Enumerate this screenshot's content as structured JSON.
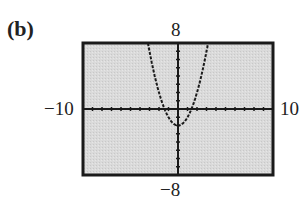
{
  "figure": {
    "part_label": "(b)",
    "window_labels": {
      "ymax": "8",
      "ymin": "−8",
      "xmin": "−10",
      "xmax": "10"
    },
    "colors": {
      "screen_background": "#d9d9d9",
      "frame": "#1a1a1a",
      "axes": "#1a1a1a",
      "curve": "#1a1a1a"
    }
  },
  "chart_data": {
    "type": "line",
    "title": "(b)",
    "xlabel": "",
    "ylabel": "",
    "xlim": [
      -10,
      10
    ],
    "ylim": [
      -8,
      8
    ],
    "xscale": 1,
    "yscale": 1,
    "grid": false,
    "legend": null,
    "series": [
      {
        "name": "y = x^2 - 2",
        "style": "dotted",
        "x": [
          -3.16,
          -3,
          -2.5,
          -2,
          -1.5,
          -1.41,
          -1,
          -0.5,
          0,
          0.5,
          1,
          1.41,
          1.5,
          2,
          2.5,
          3,
          3.16
        ],
        "y": [
          8,
          7,
          4.25,
          2,
          0.25,
          0,
          -1,
          -1.75,
          -2,
          -1.75,
          -1,
          0,
          0.25,
          2,
          4.25,
          7,
          8
        ]
      }
    ],
    "annotations": {
      "vertex": [
        0,
        -2
      ],
      "x_intercepts": [
        -1.41,
        1.41
      ]
    }
  }
}
